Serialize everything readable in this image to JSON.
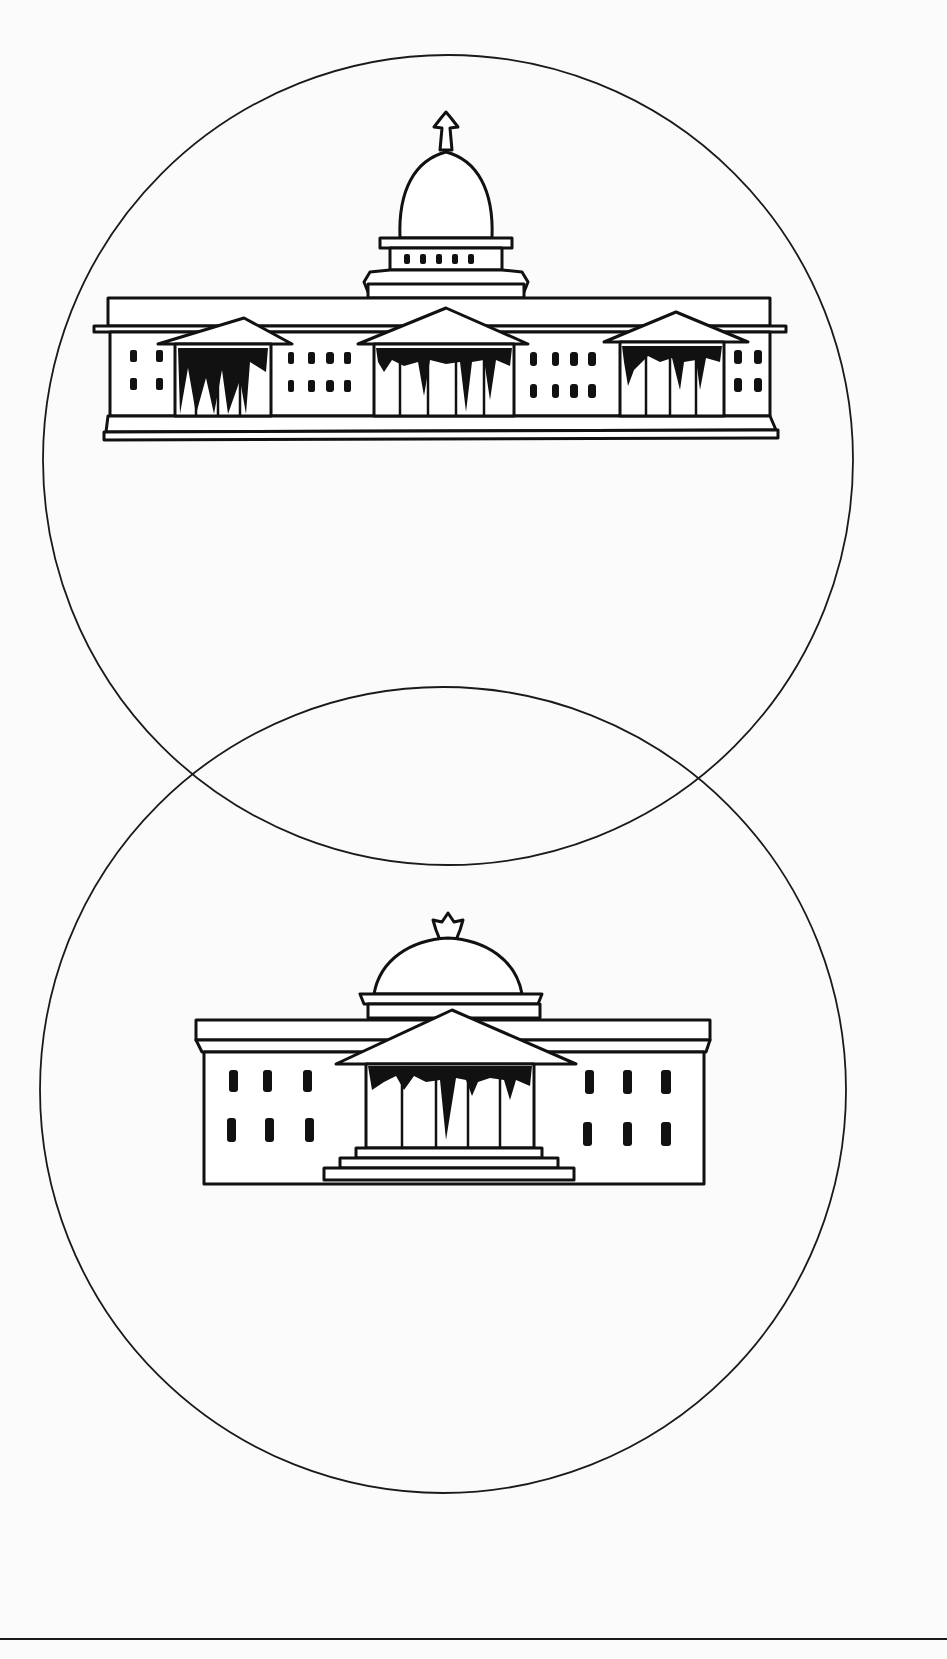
{
  "figure": {
    "stroke_color": "#1a1a1a",
    "background_color": "#fbfbfb",
    "circles": [
      {
        "name": "upper",
        "cx": 448,
        "cy": 460,
        "r": 405
      },
      {
        "name": "lower",
        "cx": 443,
        "cy": 1090,
        "r": 403
      }
    ],
    "buildings": [
      {
        "name": "upper-capitol",
        "dome": "tall",
        "porticos": 3,
        "finial": "star"
      },
      {
        "name": "lower-capitol",
        "dome": "low",
        "porticos": 1,
        "finial": "star"
      }
    ]
  },
  "footer": {
    "text": ""
  }
}
